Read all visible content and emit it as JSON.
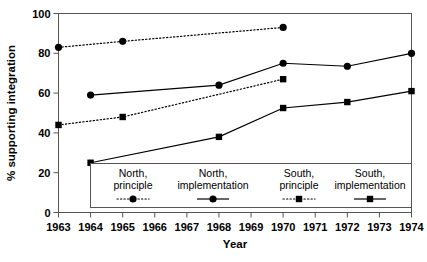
{
  "chart_data": {
    "type": "line",
    "title": "",
    "xlabel": "Year",
    "ylabel": "% supporting integration",
    "xlim": [
      1963,
      1974
    ],
    "ylim": [
      0,
      100
    ],
    "grid": false,
    "legend_position": "inside-bottom-center",
    "x_ticks": [
      "1963",
      "1964",
      "1965",
      "1966",
      "1967",
      "1968",
      "1969",
      "1970",
      "1971",
      "1972",
      "1973",
      "1974"
    ],
    "y_ticks": [
      "0",
      "20",
      "40",
      "60",
      "80",
      "100"
    ],
    "series": [
      {
        "name": "North, principle",
        "marker": "circle",
        "linestyle": "dotted",
        "color": "#000000",
        "x": [
          1963,
          1965,
          1970
        ],
        "values": [
          83,
          86,
          93
        ]
      },
      {
        "name": "North, implementation",
        "marker": "circle",
        "linestyle": "solid",
        "color": "#000000",
        "x": [
          1964,
          1968,
          1970,
          1972,
          1974
        ],
        "values": [
          59,
          64,
          75,
          73.5,
          80
        ]
      },
      {
        "name": "South, principle",
        "marker": "square",
        "linestyle": "dotted",
        "color": "#000000",
        "x": [
          1963,
          1965,
          1970
        ],
        "values": [
          44,
          48,
          67
        ]
      },
      {
        "name": "South, implementation",
        "marker": "square",
        "linestyle": "solid",
        "color": "#000000",
        "x": [
          1964,
          1968,
          1970,
          1972,
          1974
        ],
        "values": [
          25,
          38,
          52.5,
          55.5,
          61
        ]
      }
    ]
  },
  "axis": {
    "y_title": "% supporting integration",
    "x_title": "Year",
    "y_ticks": [
      "100",
      "80",
      "60",
      "40",
      "20",
      "0"
    ],
    "x_ticks": [
      "1963",
      "1964",
      "1965",
      "1966",
      "1967",
      "1968",
      "1969",
      "1970",
      "1971",
      "1972",
      "1973",
      "1974"
    ]
  },
  "legend": {
    "entries": [
      {
        "line1": "North,",
        "line2": "principle",
        "marker": "circle",
        "style": "dotted"
      },
      {
        "line1": "North,",
        "line2": "implementation",
        "marker": "circle",
        "style": "solid"
      },
      {
        "line1": "South,",
        "line2": "principle",
        "marker": "square",
        "style": "dotted"
      },
      {
        "line1": "South,",
        "line2": "implementation",
        "marker": "square",
        "style": "solid"
      }
    ]
  }
}
